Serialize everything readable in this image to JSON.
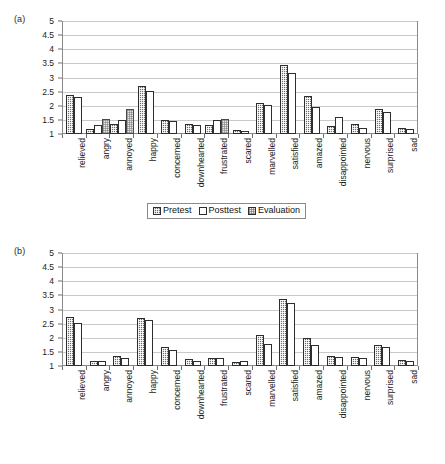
{
  "figure": {
    "panel_a_tag": "(a)",
    "panel_b_tag": "(b)"
  },
  "axis": {
    "y_ticks": [
      "5",
      "4.5",
      "4",
      "3.5",
      "3",
      "2.5",
      "2",
      "1.5",
      "1"
    ]
  },
  "legend": {
    "pretest": "Pretest",
    "posttest": "Posttest",
    "evaluation": "Evaluation"
  },
  "categories": [
    "relieved",
    "angry",
    "annoyed",
    "happy",
    "concerned",
    "downhearted",
    "frustrated",
    "scared",
    "marvelled",
    "satisfied",
    "amazed",
    "disappointed",
    "nervous",
    "surprised",
    "sad"
  ],
  "chart_data": [
    {
      "type": "bar",
      "title": "(a)",
      "xlabel": "",
      "ylabel": "",
      "ylim": [
        1,
        5
      ],
      "ytick_step": 0.5,
      "grid": true,
      "legend_position": "bottom",
      "categories": [
        "relieved",
        "angry",
        "annoyed",
        "happy",
        "concerned",
        "downhearted",
        "frustrated",
        "scared",
        "marvelled",
        "satisfied",
        "amazed",
        "disappointed",
        "nervous",
        "surprised",
        "sad"
      ],
      "series": [
        {
          "name": "Pretest",
          "values": [
            2.38,
            1.18,
            1.35,
            2.69,
            1.5,
            1.34,
            1.33,
            1.14,
            2.1,
            3.43,
            2.34,
            1.29,
            1.37,
            1.9,
            1.22
          ]
        },
        {
          "name": "Posttest",
          "values": [
            2.32,
            1.33,
            1.5,
            2.53,
            1.45,
            1.31,
            1.48,
            1.09,
            2.02,
            3.15,
            1.94,
            1.59,
            1.22,
            1.79,
            1.18
          ]
        },
        {
          "name": "Evaluation",
          "values": [
            null,
            1.54,
            1.87,
            null,
            null,
            null,
            1.53,
            null,
            null,
            null,
            null,
            null,
            null,
            null,
            null
          ]
        }
      ]
    },
    {
      "type": "bar",
      "title": "(b)",
      "xlabel": "",
      "ylabel": "",
      "ylim": [
        1,
        5
      ],
      "ytick_step": 0.5,
      "grid": true,
      "legend_position": "bottom",
      "categories": [
        "relieved",
        "angry",
        "annoyed",
        "happy",
        "concerned",
        "downhearted",
        "frustrated",
        "scared",
        "marvelled",
        "satisfied",
        "amazed",
        "disappointed",
        "nervous",
        "surprised",
        "sad"
      ],
      "series": [
        {
          "name": "Pretest",
          "values": [
            2.73,
            1.16,
            1.34,
            2.69,
            1.68,
            1.26,
            1.3,
            1.15,
            2.09,
            3.38,
            2.0,
            1.36,
            1.32,
            1.74,
            1.2
          ]
        },
        {
          "name": "Posttest",
          "values": [
            2.53,
            1.19,
            1.3,
            2.63,
            1.56,
            1.18,
            1.29,
            1.17,
            1.78,
            3.22,
            1.76,
            1.31,
            1.3,
            1.68,
            1.18
          ]
        }
      ]
    }
  ]
}
